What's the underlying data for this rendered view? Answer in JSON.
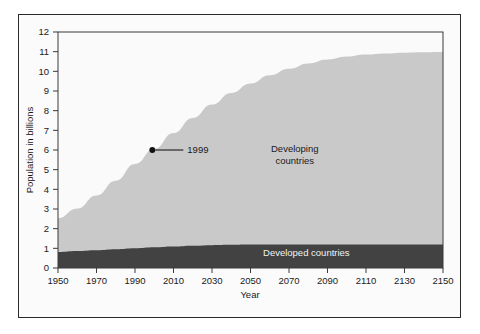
{
  "chart_data": {
    "type": "area",
    "title": "",
    "xlabel": "Year",
    "ylabel": "Population in billions",
    "xlim": [
      1950,
      2150
    ],
    "ylim": [
      0,
      12
    ],
    "grid": false,
    "stacked": true,
    "legend_position": "inline-annotation",
    "x_ticks": [
      1950,
      1970,
      1990,
      2010,
      2030,
      2050,
      2070,
      2090,
      2110,
      2130,
      2150
    ],
    "x_tick_labels": [
      "1950",
      "1970",
      "1990",
      "2010",
      "2030",
      "2050",
      "2070",
      "2090",
      "2110",
      "2130",
      "2150"
    ],
    "y_ticks": [
      0,
      1,
      2,
      3,
      4,
      5,
      6,
      7,
      8,
      9,
      10,
      11,
      12
    ],
    "y_tick_labels": [
      "0",
      "1",
      "2",
      "3",
      "4",
      "5",
      "6",
      "7",
      "8",
      "9",
      "10",
      "11",
      "12"
    ],
    "x": [
      1950,
      1960,
      1970,
      1980,
      1990,
      2000,
      2010,
      2020,
      2030,
      2040,
      2050,
      2060,
      2070,
      2080,
      2090,
      2100,
      2110,
      2120,
      2130,
      2140,
      2150
    ],
    "series": [
      {
        "name": "Developed countries",
        "color": "#424242",
        "values": [
          0.81,
          0.86,
          0.9,
          0.95,
          1.0,
          1.05,
          1.09,
          1.13,
          1.16,
          1.18,
          1.19,
          1.2,
          1.2,
          1.2,
          1.2,
          1.2,
          1.2,
          1.2,
          1.2,
          1.2,
          1.2
        ]
      },
      {
        "name": "Developing countries",
        "color": "#c9c9c9",
        "values": [
          1.72,
          2.16,
          2.79,
          3.49,
          4.29,
          5.0,
          5.77,
          6.5,
          7.15,
          7.72,
          8.19,
          8.6,
          8.93,
          9.2,
          9.4,
          9.55,
          9.65,
          9.71,
          9.75,
          9.77,
          9.78
        ]
      }
    ],
    "totals": [
      2.53,
      3.02,
      3.69,
      4.44,
      5.29,
      6.05,
      6.86,
      7.63,
      8.31,
      8.9,
      9.38,
      9.8,
      10.13,
      10.4,
      10.6,
      10.75,
      10.85,
      10.91,
      10.95,
      10.97,
      10.98
    ],
    "annotations": [
      {
        "name": "1999-marker",
        "label": "1999",
        "x": 1999,
        "y": 6.0,
        "marker": "filled-circle",
        "leader_line": true
      }
    ],
    "area_labels": [
      {
        "name": "developing-countries-label",
        "lines": [
          "Developing",
          "countries"
        ],
        "x": 2073,
        "y": 5.9
      },
      {
        "name": "developed-countries-label",
        "lines": [
          "Developed countries"
        ],
        "x": 2079,
        "y": 0.62
      }
    ],
    "colors": {
      "developing": "#c9c9c9",
      "developed": "#424242",
      "plot_background": "#fafafa",
      "figure_background": "#fbfbfb",
      "axis": "#3a3a3a",
      "text": "#1a1a1a",
      "label_inverse": "#f2f2f2"
    }
  }
}
